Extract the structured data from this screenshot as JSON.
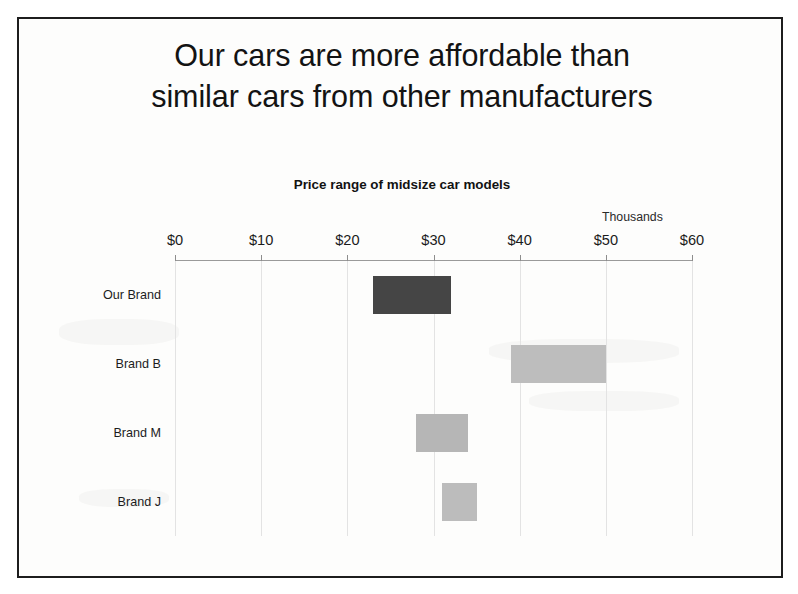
{
  "slide": {
    "title_line1": "Our cars are more affordable than",
    "title_line2": "similar cars from other manufacturers",
    "border_color": "#1d1d1d",
    "background_color": "#fdfdfc"
  },
  "chart_data": {
    "type": "bar",
    "subtype": "floating-range-bar",
    "title": "Price range of midsize car models",
    "units_note": "Thousands",
    "xlabel": "",
    "ylabel": "",
    "orientation": "horizontal",
    "grid": true,
    "legend": "none",
    "xlim": [
      0,
      60
    ],
    "xticks": [
      0,
      10,
      20,
      30,
      40,
      50,
      60
    ],
    "xtick_labels": [
      "$0",
      "$10",
      "$20",
      "$30",
      "$40",
      "$50",
      "$60"
    ],
    "categories": [
      "Our Brand",
      "Brand B",
      "Brand M",
      "Brand J"
    ],
    "bars": [
      {
        "category": "Our Brand",
        "low": 23,
        "high": 32,
        "color": "#454545"
      },
      {
        "category": "Brand B",
        "low": 39,
        "high": 50,
        "color": "#bdbdbd"
      },
      {
        "category": "Brand M",
        "low": 28,
        "high": 34,
        "color": "#b6b6b6"
      },
      {
        "category": "Brand J",
        "low": 31,
        "high": 35,
        "color": "#bcbcbc"
      }
    ],
    "series": [
      {
        "name": "Low price",
        "values": [
          23,
          39,
          28,
          31
        ]
      },
      {
        "name": "High price",
        "values": [
          32,
          50,
          34,
          35
        ]
      }
    ],
    "highlight_category": "Our Brand",
    "highlight_color": "#454545",
    "other_color": "#bdbdbd"
  }
}
